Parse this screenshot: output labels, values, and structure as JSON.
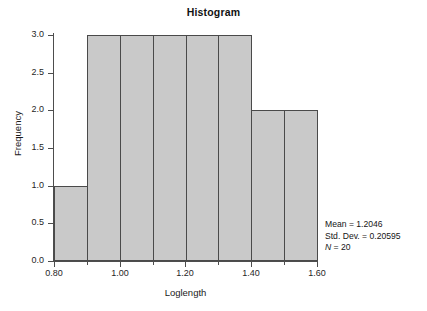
{
  "chart_data": {
    "type": "bar",
    "title": "Histogram",
    "xlabel": "Loglength",
    "ylabel": "Frequency",
    "xlim": [
      0.8,
      1.6
    ],
    "ylim": [
      0.0,
      3.0
    ],
    "grid": false,
    "legend": "none",
    "bin_width": 0.1,
    "bin_edges": [
      0.8,
      0.9,
      1.0,
      1.1,
      1.2,
      1.3,
      1.4,
      1.5,
      1.6
    ],
    "categories": [
      "0.80-0.90",
      "0.90-1.00",
      "1.00-1.10",
      "1.10-1.20",
      "1.20-1.30",
      "1.30-1.40",
      "1.40-1.50",
      "1.50-1.60"
    ],
    "values": [
      1,
      3,
      3,
      3,
      3,
      3,
      2,
      2
    ],
    "bar_fill": "#c9c9c9",
    "bar_edge": "#4a4a4a",
    "x_ticks_major": [
      "0.80",
      "1.00",
      "1.20",
      "1.40",
      "1.60"
    ],
    "x_tick_values_major": [
      0.8,
      1.0,
      1.2,
      1.4,
      1.6
    ],
    "x_tick_values_minor": [
      0.9,
      1.1,
      1.3,
      1.5
    ],
    "y_ticks": [
      "0.0",
      "0.5",
      "1.0",
      "1.5",
      "2.0",
      "2.5",
      "3.0"
    ],
    "y_tick_values": [
      0.0,
      0.5,
      1.0,
      1.5,
      2.0,
      2.5,
      3.0
    ],
    "annotations": {
      "mean_label": "Mean = 1.2046",
      "stddev_label": "Std. Dev. = 0.20595",
      "n_symbol": "N",
      "n_rest": " = 20",
      "mean": 1.2046,
      "std_dev": 0.20595,
      "n": 20
    }
  }
}
